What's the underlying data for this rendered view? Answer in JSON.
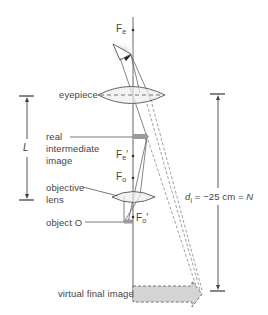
{
  "diagram": {
    "labels": {
      "fe_main": "F",
      "fe_sub": "e",
      "eyepiece": "eyepiece",
      "real_image_line1": "real",
      "real_image_line2": "intermediate",
      "real_image_line3": "image",
      "fe_prime_main": "F",
      "fe_prime_sub": "e",
      "fe_prime_mark": "′",
      "fo_main": "F",
      "fo_sub": "o",
      "objective_line1": "objective",
      "objective_line2": "lens",
      "object": "object O",
      "fo_prime_main": "F",
      "fo_prime_sub": "o",
      "fo_prime_mark": "′",
      "virtual_image": "virtual final image",
      "tube_length": "L",
      "image_distance_var": "d",
      "image_distance_sub": "i",
      "image_distance_eq": " = −25 cm = ",
      "near_point": "N"
    },
    "colors": {
      "lines": "#555555",
      "lens_fill": "#eeeeee",
      "image_fill": "#aaaaaa",
      "virtual_fill": "#d4d4d4"
    }
  }
}
